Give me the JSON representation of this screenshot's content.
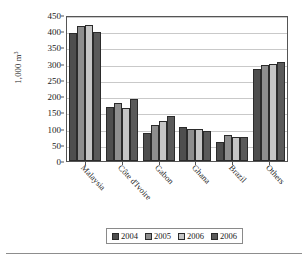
{
  "chart_data": {
    "type": "bar",
    "title": "",
    "xlabel": "",
    "ylabel": "1,000 m",
    "ylabel_exponent": "3",
    "ylim": [
      0,
      450
    ],
    "ytick_step": 50,
    "yticks": [
      0,
      50,
      100,
      150,
      200,
      250,
      300,
      350,
      400,
      450
    ],
    "grid": true,
    "legend_position": "bottom",
    "categories": [
      "Malaysia",
      "Côte d'Ivoire",
      "Gabon",
      "Ghana",
      "Brazil",
      "Others"
    ],
    "series": [
      {
        "name": "2004",
        "color": "#4e4e4e",
        "values": [
          395,
          168,
          87,
          104,
          58,
          285
        ]
      },
      {
        "name": "2005",
        "color": "#8e8e8e",
        "values": [
          415,
          180,
          111,
          99,
          80,
          295
        ]
      },
      {
        "name": "2006",
        "color": "#c5c5c5",
        "values": [
          420,
          162,
          123,
          98,
          74,
          300
        ]
      },
      {
        "name": "2006",
        "color": "#5a5a5a",
        "values": [
          397,
          192,
          140,
          93,
          74,
          305
        ]
      }
    ]
  },
  "legend": {
    "items": [
      {
        "label": "2004"
      },
      {
        "label": "2005"
      },
      {
        "label": "2006"
      },
      {
        "label": "2006"
      }
    ]
  }
}
